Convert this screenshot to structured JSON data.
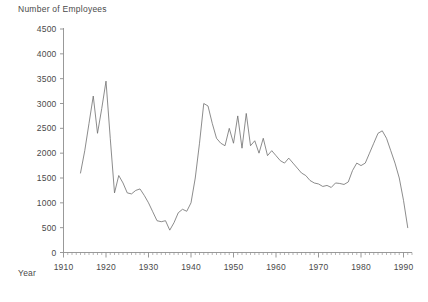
{
  "figure": {
    "y_axis_title": "Number of Employees",
    "x_axis_title": "Year"
  },
  "chart_data": {
    "type": "line",
    "title": "",
    "subtitle": "",
    "xlabel": "Year",
    "ylabel": "Number of Employees",
    "xlim": [
      1910,
      1992
    ],
    "ylim": [
      0,
      4500
    ],
    "grid": false,
    "legend": "none",
    "y_ticks": [
      0,
      500,
      1000,
      1500,
      2000,
      2500,
      3000,
      3500,
      4000,
      4500
    ],
    "y_tick_labels": [
      "0",
      "500",
      "1000",
      "1500",
      "2000",
      "2500",
      "3000",
      "3500",
      "4000",
      "4500"
    ],
    "x_ticks": [
      1910,
      1920,
      1930,
      1940,
      1950,
      1960,
      1970,
      1980,
      1990
    ],
    "x_tick_labels": [
      "1910",
      "1920",
      "1930",
      "1940",
      "1950",
      "1960",
      "1970",
      "1980",
      "1990"
    ],
    "x_minor_tick_interval": 1,
    "series": [
      {
        "name": "Number of Employees",
        "color": "#6e6e6e",
        "x": [
          1914,
          1915,
          1916,
          1917,
          1918,
          1919,
          1920,
          1921,
          1922,
          1923,
          1924,
          1925,
          1926,
          1927,
          1928,
          1929,
          1930,
          1931,
          1932,
          1933,
          1934,
          1935,
          1936,
          1937,
          1938,
          1939,
          1940,
          1941,
          1942,
          1943,
          1944,
          1945,
          1946,
          1947,
          1948,
          1949,
          1950,
          1951,
          1952,
          1953,
          1954,
          1955,
          1956,
          1957,
          1958,
          1959,
          1960,
          1961,
          1962,
          1963,
          1964,
          1965,
          1966,
          1967,
          1968,
          1969,
          1970,
          1971,
          1972,
          1973,
          1974,
          1975,
          1976,
          1977,
          1978,
          1979,
          1980,
          1981,
          1982,
          1983,
          1984,
          1985,
          1986,
          1987,
          1988,
          1989,
          1990,
          1991
        ],
        "values": [
          1600,
          2050,
          2600,
          3150,
          2400,
          2900,
          3450,
          2300,
          1200,
          1550,
          1400,
          1200,
          1180,
          1250,
          1280,
          1150,
          1000,
          820,
          640,
          620,
          640,
          450,
          600,
          800,
          870,
          830,
          1000,
          1500,
          2200,
          3000,
          2950,
          2600,
          2300,
          2200,
          2150,
          2500,
          2200,
          2750,
          2100,
          2800,
          2150,
          2250,
          2000,
          2300,
          1950,
          2050,
          1950,
          1850,
          1800,
          1900,
          1800,
          1700,
          1600,
          1550,
          1450,
          1400,
          1380,
          1330,
          1350,
          1310,
          1400,
          1390,
          1370,
          1420,
          1650,
          1800,
          1750,
          1800,
          2000,
          2200,
          2400,
          2450,
          2300,
          2050,
          1800,
          1500,
          1050,
          500
        ]
      }
    ]
  }
}
